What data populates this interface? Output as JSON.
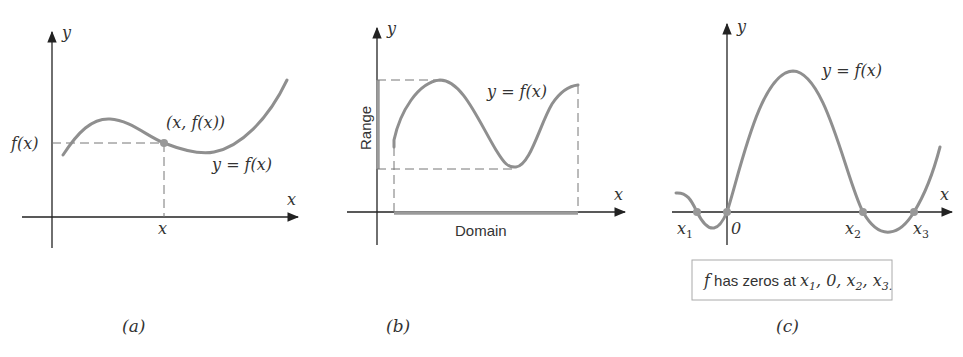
{
  "figure": {
    "panel_a": {
      "caption": "(a)",
      "x_axis_label": "x",
      "y_axis_label": "y",
      "point_label": "(x, f(x))",
      "curve_label": "y = f(x)",
      "y_tick_label": "f(x)",
      "x_tick_label": "x"
    },
    "panel_b": {
      "caption": "(b)",
      "x_axis_label": "x",
      "y_axis_label": "y",
      "curve_label": "y = f(x)",
      "range_label": "Range",
      "domain_label": "Domain"
    },
    "panel_c": {
      "caption": "(c)",
      "x_axis_label": "x",
      "y_axis_label": "y",
      "curve_label": "y = f(x)",
      "zero_labels": [
        "x",
        "0",
        "x",
        "x"
      ],
      "zero_subscripts": [
        "1",
        "",
        "2",
        "3"
      ],
      "note": {
        "f": "f",
        "text": " has zeros at ",
        "terms": [
          "x",
          "1",
          ", 0, ",
          "x",
          "2",
          ", ",
          "x",
          "3."
        ]
      }
    }
  },
  "colors": {
    "curve": "#8f8f8f",
    "axis": "#222222",
    "text": "#333333"
  }
}
